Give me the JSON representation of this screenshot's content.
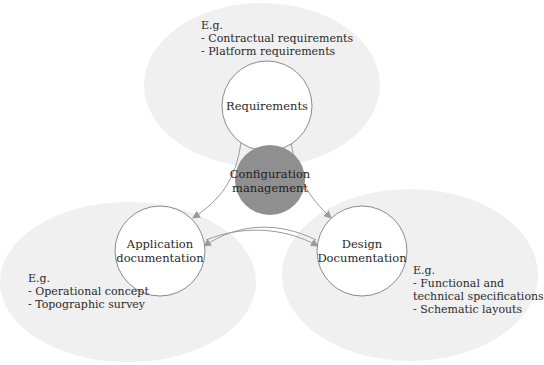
{
  "diagram": {
    "type": "cycle",
    "colors": {
      "background": "#ffffff",
      "blob": "#f0f0f0",
      "node_fill": "#ffffff",
      "node_stroke": "#8a8a8a",
      "center_fill": "#8f8f8f",
      "arrow": "#9a9a9a",
      "text": "#2a2a2a"
    },
    "center": {
      "label_line1": "Configuration",
      "label_line2": "management"
    },
    "nodes": [
      {
        "id": "requirements",
        "label_line1": "Requirements",
        "label_line2": "",
        "note_heading": "E.g.",
        "note_lines": [
          "- Contractual requirements",
          "- Platform requirements"
        ]
      },
      {
        "id": "application",
        "label_line1": "Application",
        "label_line2": "documentation",
        "note_heading": "E.g.",
        "note_lines": [
          "- Operational concept",
          "- Topographic survey"
        ]
      },
      {
        "id": "design",
        "label_line1": "Design",
        "label_line2": "Documentation",
        "note_heading": "E.g.",
        "note_lines": [
          "- Functional and",
          "technical specifications",
          "- Schematic layouts"
        ]
      }
    ],
    "edges": [
      {
        "from": "requirements",
        "to": "application"
      },
      {
        "from": "requirements",
        "to": "design"
      },
      {
        "from": "design",
        "to": "application"
      },
      {
        "from": "application",
        "to": "design"
      }
    ]
  }
}
